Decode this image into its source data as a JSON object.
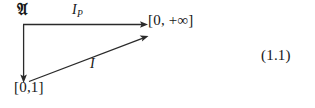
{
  "figure": {
    "name": "commutative-diagram",
    "equation_number": "(1.1)",
    "background_color": "#ffffff",
    "ink_color": "#2a2a2a"
  },
  "nodes": [
    {
      "id": "algebra",
      "label": "𝔄",
      "description": "fraktur-A-algebra",
      "position": "top-left"
    },
    {
      "id": "codomain",
      "label": "[0, +∞]",
      "description": "extended-nonnegative-reals",
      "position": "top-right"
    },
    {
      "id": "unit-interval",
      "label": "[0,1]",
      "description": "closed-unit-interval",
      "position": "bottom-left"
    }
  ],
  "arrows": [
    {
      "id": "horizontal",
      "from": "algebra",
      "to": "codomain",
      "label": "I",
      "label_subscript": "P",
      "label_full": "I_P",
      "direction": "right"
    },
    {
      "id": "vertical",
      "from": "algebra",
      "to": "unit-interval",
      "label": "",
      "direction": "down"
    },
    {
      "id": "diagonal",
      "from": "unit-interval",
      "to": "codomain",
      "label": "I",
      "direction": "up-right"
    }
  ]
}
